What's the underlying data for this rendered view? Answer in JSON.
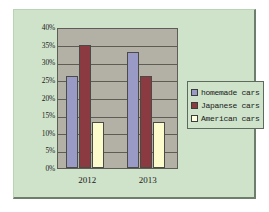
{
  "chart_data": {
    "type": "bar",
    "title": "",
    "xlabel": "",
    "ylabel": "",
    "categories": [
      "2012",
      "2013"
    ],
    "series": [
      {
        "name": "homemade cars",
        "values": [
          26,
          33
        ],
        "color": "#9a9ac6"
      },
      {
        "name": "Japanese cars",
        "values": [
          35,
          26
        ],
        "color": "#8b3a42"
      },
      {
        "name": "American cars",
        "values": [
          13,
          13
        ],
        "color": "#fbfbcb"
      }
    ],
    "ylim": [
      0,
      40
    ],
    "ytick_values": [
      0,
      5,
      10,
      15,
      20,
      25,
      30,
      35,
      40
    ],
    "ytick_labels": [
      "0%",
      "5%",
      "10%",
      "15%",
      "20%",
      "25%",
      "30%",
      "35%",
      "40%"
    ],
    "grid": true,
    "legend_position": "right",
    "plot_background": "#b3b0a6",
    "chart_background": "#cfe3cb"
  },
  "legend": {
    "items": [
      {
        "label": "homemade cars"
      },
      {
        "label": "Japanese cars"
      },
      {
        "label": "American cars"
      }
    ]
  }
}
